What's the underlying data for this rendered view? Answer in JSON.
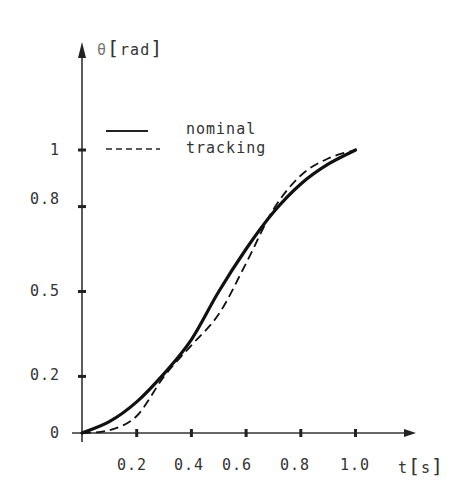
{
  "chart_data": {
    "type": "line",
    "title": "",
    "xlabel": "t[s]",
    "ylabel": "θ[rad]",
    "x_ticks": [
      0.2,
      0.4,
      0.6,
      0.8,
      1.0
    ],
    "x_tick_labels": [
      "0.2",
      "0.4",
      "0.6",
      "0.8",
      "1.0"
    ],
    "y_ticks": [
      0,
      0.2,
      0.5,
      0.8,
      1
    ],
    "y_tick_labels": [
      "0",
      "0.2",
      "0.5",
      "0.8",
      "1"
    ],
    "xlim": [
      0,
      1.2
    ],
    "ylim": [
      0,
      1.1
    ],
    "grid": false,
    "legend_position": "upper left",
    "x": [
      0,
      0.1,
      0.2,
      0.3,
      0.4,
      0.5,
      0.6,
      0.7,
      0.8,
      0.9,
      1.0
    ],
    "series": [
      {
        "name": "nominal",
        "style": "solid",
        "values": [
          0,
          0.04,
          0.11,
          0.21,
          0.33,
          0.5,
          0.65,
          0.78,
          0.88,
          0.95,
          1.0
        ]
      },
      {
        "name": "tracking",
        "style": "dashed",
        "values": [
          0,
          0.01,
          0.06,
          0.2,
          0.31,
          0.42,
          0.6,
          0.79,
          0.91,
          0.97,
          1.0
        ]
      }
    ]
  },
  "axes": {
    "x_label_t": "t",
    "x_label_unit": "s",
    "y_label_theta": "θ",
    "y_label_unit": "rad"
  },
  "legend": {
    "items": [
      {
        "label": "nominal",
        "style": "solid"
      },
      {
        "label": "tracking",
        "style": "dashed"
      }
    ]
  }
}
